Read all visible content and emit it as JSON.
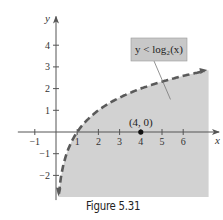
{
  "caption": "Figure 5.31",
  "chart_data": {
    "type": "area",
    "title": "",
    "xlabel": "x",
    "ylabel": "y",
    "xlim": [
      -1.8,
      7.5
    ],
    "ylim": [
      -3,
      5
    ],
    "xticks": [
      -1,
      1,
      2,
      3,
      4,
      5,
      6
    ],
    "yticks": [
      -2,
      -1,
      1,
      2,
      3,
      4
    ],
    "xtick_labels": [
      "−1",
      "1",
      "2",
      "3",
      "4",
      "5",
      "6"
    ],
    "ytick_labels": [
      "−2",
      "−1",
      "1",
      "2",
      "3",
      "4"
    ],
    "grid": false,
    "series": [
      {
        "name": "y = log2(x)",
        "function": "log2(x)",
        "style": "dashed",
        "x_range": [
          0.14,
          7.0
        ],
        "shaded_region": "below curve (y < log2(x))"
      }
    ],
    "shade_bounds": {
      "x_max": 7.2,
      "y_min": -3.0
    },
    "annotations": [
      {
        "text": "y < log₂(x)",
        "type": "callout",
        "points_to": [
          5.4,
          1.5
        ]
      },
      {
        "text": "(4, 0)",
        "type": "point",
        "x": 4,
        "y": 0
      }
    ],
    "colors": {
      "shade": "#d2d2d2",
      "curve": "#5a5a5a",
      "axis": "#555555",
      "callout_bg": "#c8c8c8"
    }
  }
}
